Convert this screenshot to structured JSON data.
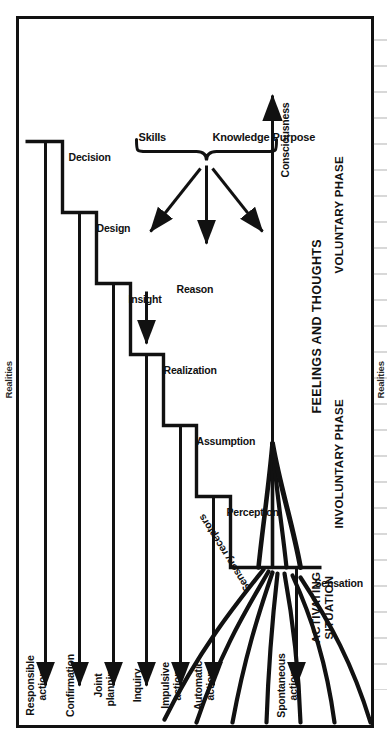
{
  "diagram": {
    "orientation": "rotated-90-ccw",
    "frame": {
      "border_color": "#111111",
      "background": "#ffffff"
    },
    "edge_labels": {
      "top": "Realities",
      "bottom": "Realities"
    },
    "phases": [
      {
        "id": "activating-situation",
        "label_line1": "ACTIVATING",
        "label_line2": "SITUATION"
      },
      {
        "id": "involuntary-phase",
        "label": "INVOLUNTARY PHASE"
      },
      {
        "id": "voluntary-phase",
        "label": "VOLUNTARY PHASE"
      }
    ],
    "zone_label": "FEELINGS AND THOUGHTS",
    "input_funnel": {
      "receptors_label": "Sensory receptors",
      "output_label": "Consciousness",
      "ray_count": 7,
      "converging_strand_count": 4
    },
    "steps": [
      {
        "id": "sensation",
        "step_label": "Sensation",
        "action_line1": "Spontaneous",
        "action_line2": "action",
        "phase": "involuntary-phase"
      },
      {
        "id": "perception",
        "step_label": "Perception",
        "action_line1": "Automatic",
        "action_line2": "action",
        "phase": "involuntary-phase"
      },
      {
        "id": "assumption",
        "step_label": "Assumption",
        "action_line1": "Impulsive",
        "action_line2": "action",
        "phase": "involuntary-phase"
      },
      {
        "id": "realization",
        "step_label": "Realization",
        "action_line1": "Inquiry",
        "action_line2": "",
        "phase": "involuntary-phase"
      },
      {
        "id": "insight",
        "step_label": "Insight",
        "action_line1": "Joint",
        "action_line2": "planning",
        "phase": "voluntary-phase"
      },
      {
        "id": "design",
        "step_label": "Design",
        "action_line1": "Confirmation",
        "action_line2": "",
        "phase": "voluntary-phase"
      },
      {
        "id": "decision",
        "step_label": "Decision",
        "action_line1": "Responsible",
        "action_line2": "action",
        "phase": "voluntary-phase"
      }
    ],
    "inputs": [
      {
        "id": "reason",
        "label": "Reason",
        "feeds": "realization"
      }
    ],
    "resource_brace": {
      "items": [
        "Purpose",
        "Knowledge",
        "Skills"
      ],
      "feeds": [
        "insight",
        "design",
        "decision"
      ],
      "arrow_count": 3
    }
  }
}
